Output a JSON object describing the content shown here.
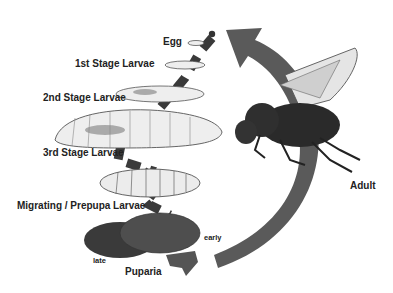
{
  "stages": [
    {
      "id": "egg",
      "label": "Egg"
    },
    {
      "id": "larva1",
      "label": "1st Stage Larvae"
    },
    {
      "id": "larva2",
      "label": "2nd Stage Larvae"
    },
    {
      "id": "larva3",
      "label": "3rd Stage Larvae"
    },
    {
      "id": "prepupa",
      "label": "Migrating / Prepupa Larvae"
    },
    {
      "id": "puparia",
      "label": "Puparia",
      "sublabels": {
        "early": "early",
        "late": "late"
      }
    },
    {
      "id": "adult",
      "label": "Adult"
    }
  ],
  "colors": {
    "arrow": "#555555",
    "larva_fill": "#eeeeee",
    "pupa_dark": "#3a3a3a",
    "pupa_mid": "#555555",
    "fly_body": "#2a2a2a"
  }
}
